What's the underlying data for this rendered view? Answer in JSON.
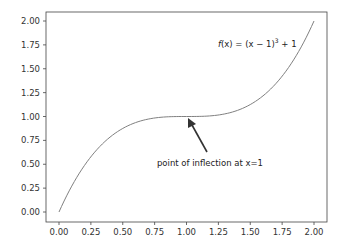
{
  "chart_data": {
    "type": "line",
    "title": "",
    "xlabel": "",
    "ylabel": "",
    "xlim": [
      -0.1,
      2.1
    ],
    "ylim": [
      -0.1,
      2.1
    ],
    "grid": false,
    "legend": null,
    "x_ticks": [
      "0.00",
      "0.25",
      "0.50",
      "0.75",
      "1.00",
      "1.25",
      "1.50",
      "1.75",
      "2.00"
    ],
    "y_ticks": [
      "0.00",
      "0.25",
      "0.50",
      "0.75",
      "1.00",
      "1.25",
      "1.50",
      "1.75",
      "2.00"
    ],
    "series": [
      {
        "name": "f(x) = (x - 1)^3 + 1",
        "color": "#808080",
        "x": [
          0,
          0.1,
          0.2,
          0.3,
          0.4,
          0.5,
          0.6,
          0.7,
          0.8,
          0.9,
          1.0,
          1.1,
          1.2,
          1.3,
          1.4,
          1.5,
          1.6,
          1.7,
          1.8,
          1.9,
          2.0
        ],
        "values": [
          0,
          0.271,
          0.488,
          0.657,
          0.784,
          0.875,
          0.936,
          0.973,
          0.992,
          0.999,
          1.0,
          1.001,
          1.008,
          1.027,
          1.064,
          1.125,
          1.216,
          1.343,
          1.512,
          1.729,
          2.0
        ]
      }
    ],
    "annotations": [
      {
        "text": "f(x) = (x − 1)³ + 1",
        "x": 1.6,
        "y": 1.78
      },
      {
        "text": "point of inflection at x=1",
        "xy": [
          1.0,
          1.0
        ],
        "xytext": [
          1.15,
          0.55
        ],
        "arrow": true
      }
    ]
  },
  "labels": {
    "formula_f": "f",
    "formula_rest": "(x) = (x − 1)",
    "formula_exp": "3",
    "formula_tail": " + 1",
    "inflection": "point of inflection at x=1"
  }
}
